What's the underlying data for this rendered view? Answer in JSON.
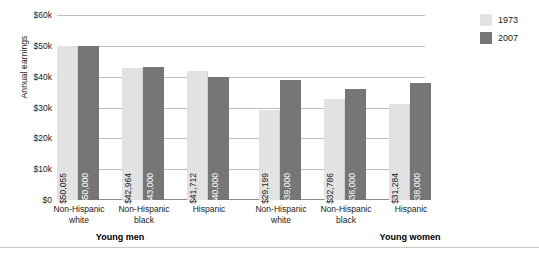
{
  "chart_data": {
    "type": "bar",
    "title": "",
    "xlabel": "",
    "ylabel": "Annual earnings",
    "ylim": [
      0,
      60000
    ],
    "ytick_labels": [
      "$0",
      "$10k",
      "$20k",
      "$30k",
      "$40k",
      "$50k",
      "$60k"
    ],
    "ytick_values": [
      0,
      10000,
      20000,
      30000,
      40000,
      50000,
      60000
    ],
    "grid": true,
    "legend_position": "right",
    "groups": [
      {
        "label": "Young men",
        "categories": [
          "Non-Hispanic white",
          "Non-Hispanic black",
          "Hispanic"
        ]
      },
      {
        "label": "Young women",
        "categories": [
          "Non-Hispanic white",
          "Non-Hispanic black",
          "Hispanic"
        ]
      }
    ],
    "categories": [
      "Non-Hispanic white",
      "Non-Hispanic black",
      "Hispanic",
      "Non-Hispanic white",
      "Non-Hispanic black",
      "Hispanic"
    ],
    "series": [
      {
        "name": "1973",
        "color": "#e2e2e2",
        "values": [
          50055,
          42964,
          41712,
          29199,
          32786,
          31284
        ],
        "labels": [
          "$50,055",
          "$42,964",
          "$41,712",
          "$29,199",
          "$32,786",
          "$31,284"
        ]
      },
      {
        "name": "2007",
        "color": "#767676",
        "values": [
          50000,
          43000,
          40000,
          39000,
          36000,
          38000
        ],
        "labels": [
          "$50,000",
          "$43,000",
          "$40,000",
          "$39,000",
          "$36,000",
          "$38,000"
        ]
      }
    ]
  },
  "axis": {
    "y_title": "Annual earnings",
    "ticks": [
      {
        "label": "$60k"
      },
      {
        "label": "$50k"
      },
      {
        "label": "$40k"
      },
      {
        "label": "$30k"
      },
      {
        "label": "$20k"
      },
      {
        "label": "$10k"
      },
      {
        "label": "$0"
      }
    ]
  },
  "categories": [
    {
      "line1": "Non-Hispanic",
      "line2": "white"
    },
    {
      "line1": "Non-Hispanic",
      "line2": "black"
    },
    {
      "line1": "Hispanic",
      "line2": ""
    },
    {
      "line1": "Non-Hispanic",
      "line2": "white"
    },
    {
      "line1": "Non-Hispanic",
      "line2": "black"
    },
    {
      "line1": "Hispanic",
      "line2": ""
    }
  ],
  "groups": [
    {
      "label": "Young men"
    },
    {
      "label": "Young women"
    }
  ],
  "legend": {
    "items": [
      {
        "label": "1973",
        "color": "#e2e2e2"
      },
      {
        "label": "2007",
        "color": "#767676"
      }
    ]
  },
  "bars": [
    {
      "label": "$50,055",
      "value": 50055,
      "series": "1973"
    },
    {
      "label": "$50,000",
      "value": 50000,
      "series": "2007"
    },
    {
      "label": "$42,964",
      "value": 42964,
      "series": "1973"
    },
    {
      "label": "$43,000",
      "value": 43000,
      "series": "2007"
    },
    {
      "label": "$41,712",
      "value": 41712,
      "series": "1973"
    },
    {
      "label": "$40,000",
      "value": 40000,
      "series": "2007"
    },
    {
      "label": "$29,199",
      "value": 29199,
      "series": "1973"
    },
    {
      "label": "$39,000",
      "value": 39000,
      "series": "2007"
    },
    {
      "label": "$32,786",
      "value": 32786,
      "series": "1973"
    },
    {
      "label": "$36,000",
      "value": 36000,
      "series": "2007"
    },
    {
      "label": "$31,284",
      "value": 31284,
      "series": "1973"
    },
    {
      "label": "$38,000",
      "value": 38000,
      "series": "2007"
    }
  ]
}
